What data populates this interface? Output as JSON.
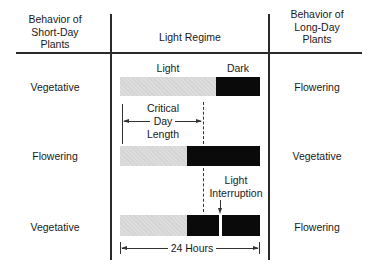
{
  "headers": {
    "short_day": [
      "Behavior of",
      "Short-Day",
      "Plants"
    ],
    "light_regime": "Light Regime",
    "long_day": [
      "Behavior of",
      "Long-Day",
      "Plants"
    ]
  },
  "bar_labels": {
    "light": "Light",
    "dark": "Dark"
  },
  "rows": [
    {
      "short_day": "Vegetative",
      "long_day": "Flowering"
    },
    {
      "short_day": "Flowering",
      "long_day": "Vegetative"
    },
    {
      "short_day": "Vegetative",
      "long_day": "Flowering"
    }
  ],
  "annotations": {
    "critical_day_length": [
      "Critical",
      "Day",
      "Length"
    ],
    "light_interruption": [
      "Light",
      "Interruption"
    ],
    "twenty_four_hours": "24 Hours"
  },
  "colors": {
    "light_period": "#dcdcdc",
    "dark_period": "#0a0a0a",
    "lines": "#2a2a2a"
  }
}
